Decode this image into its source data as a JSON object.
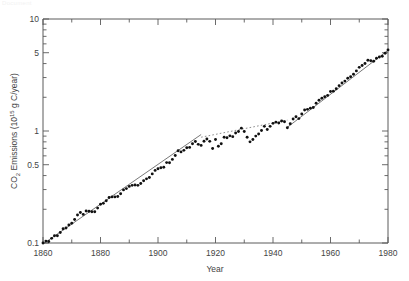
{
  "figure": {
    "faint_top_text": "Document",
    "background_color": "#ffffff",
    "axis_color": "#5a5a5a",
    "marker_color": "#111111",
    "fitline_color": "#555555"
  },
  "labels": {
    "y_title_main": "CO",
    "y_title_sub": "2",
    "y_title_mid": " Emissions (10",
    "y_title_sup": "15",
    "y_title_tail": " g C/year)",
    "y_title_full": "CO2 Emissions (10^15 g C/year)",
    "x_title": "Year",
    "y_ticks": [
      "10",
      "5",
      "1",
      "0.5",
      "0.1"
    ],
    "x_ticks": [
      "1860",
      "1880",
      "1900",
      "1920",
      "1940",
      "1960",
      "1980"
    ]
  },
  "chart_data": {
    "type": "scatter",
    "title": "",
    "subtitle": "",
    "xlabel": "Year",
    "ylabel": "CO2 Emissions (10^15 g C/year)",
    "xlim": [
      1860,
      1980
    ],
    "ylim": [
      0.1,
      10
    ],
    "yscale": "log",
    "xscale": "linear",
    "grid": false,
    "legend": "none",
    "x_major_ticks": [
      1860,
      1880,
      1900,
      1920,
      1940,
      1960,
      1980
    ],
    "x_minor_ticks": [
      1870,
      1890,
      1910,
      1930,
      1950,
      1970
    ],
    "y_labeled_ticks": [
      0.1,
      0.5,
      1,
      5,
      10
    ],
    "y_minor_ticks": [
      0.2,
      0.3,
      0.4,
      0.6,
      0.7,
      0.8,
      0.9,
      2,
      3,
      4,
      6,
      7,
      8,
      9
    ],
    "series": [
      {
        "name": "CO2 emissions from fossil fuel",
        "marker": "filled-circle",
        "x": [
          1860,
          1861,
          1862,
          1863,
          1864,
          1865,
          1866,
          1867,
          1868,
          1869,
          1870,
          1871,
          1872,
          1873,
          1874,
          1875,
          1876,
          1877,
          1878,
          1879,
          1880,
          1881,
          1882,
          1883,
          1884,
          1885,
          1886,
          1887,
          1888,
          1889,
          1890,
          1891,
          1892,
          1893,
          1894,
          1895,
          1896,
          1897,
          1898,
          1899,
          1900,
          1901,
          1902,
          1903,
          1904,
          1905,
          1906,
          1907,
          1908,
          1909,
          1910,
          1911,
          1912,
          1913,
          1914,
          1915,
          1916,
          1917,
          1918,
          1919,
          1920,
          1921,
          1922,
          1923,
          1924,
          1925,
          1926,
          1927,
          1928,
          1929,
          1930,
          1931,
          1932,
          1933,
          1934,
          1935,
          1936,
          1937,
          1938,
          1939,
          1940,
          1941,
          1942,
          1943,
          1944,
          1945,
          1946,
          1947,
          1948,
          1949,
          1950,
          1951,
          1952,
          1953,
          1954,
          1955,
          1956,
          1957,
          1958,
          1959,
          1960,
          1961,
          1962,
          1963,
          1964,
          1965,
          1966,
          1967,
          1968,
          1969,
          1970,
          1971,
          1972,
          1973,
          1974,
          1975,
          1976,
          1977,
          1978,
          1979,
          1980
        ],
        "y": [
          0.1,
          0.104,
          0.103,
          0.11,
          0.116,
          0.116,
          0.124,
          0.134,
          0.136,
          0.145,
          0.15,
          0.162,
          0.178,
          0.187,
          0.18,
          0.193,
          0.192,
          0.19,
          0.19,
          0.205,
          0.222,
          0.226,
          0.238,
          0.255,
          0.258,
          0.258,
          0.26,
          0.275,
          0.298,
          0.306,
          0.32,
          0.327,
          0.33,
          0.327,
          0.34,
          0.36,
          0.374,
          0.384,
          0.414,
          0.445,
          0.46,
          0.47,
          0.474,
          0.522,
          0.52,
          0.558,
          0.604,
          0.666,
          0.651,
          0.672,
          0.708,
          0.714,
          0.77,
          0.806,
          0.76,
          0.744,
          0.81,
          0.848,
          0.808,
          0.698,
          0.84,
          0.73,
          0.77,
          0.88,
          0.87,
          0.905,
          0.89,
          0.96,
          0.99,
          1.06,
          0.99,
          0.88,
          0.8,
          0.84,
          0.9,
          0.94,
          1.01,
          1.1,
          1.03,
          1.1,
          1.17,
          1.2,
          1.18,
          1.23,
          1.21,
          1.07,
          1.16,
          1.28,
          1.34,
          1.29,
          1.42,
          1.54,
          1.56,
          1.6,
          1.62,
          1.77,
          1.88,
          1.96,
          2.02,
          2.08,
          2.25,
          2.27,
          2.38,
          2.54,
          2.68,
          2.79,
          2.96,
          3.05,
          3.21,
          3.44,
          3.7,
          3.84,
          4.01,
          4.28,
          4.24,
          4.2,
          4.46,
          4.58,
          4.65,
          4.94,
          5.3
        ]
      }
    ],
    "fit_lines": [
      {
        "name": "pre-WWI exponential trend",
        "x_range": [
          1860,
          1915
        ],
        "y_range": [
          0.098,
          0.93
        ],
        "style": "solid"
      },
      {
        "name": "post-WWII exponential trend",
        "x_range": [
          1945,
          1980
        ],
        "y_range": [
          1.08,
          5.25
        ],
        "style": "solid"
      },
      {
        "name": "interwar connecting trend",
        "x_range": [
          1915,
          1945
        ],
        "y_range": [
          0.88,
          1.25
        ],
        "style": "dashed-faint"
      }
    ]
  }
}
